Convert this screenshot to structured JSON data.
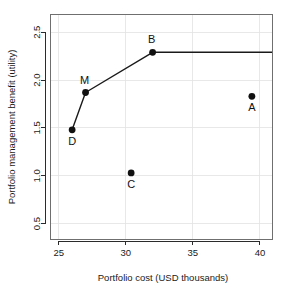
{
  "chart_data": {
    "type": "scatter",
    "title": "",
    "xlabel": "Portfolio cost (USD thousands)",
    "ylabel": "Portfolio management benefit (utility)",
    "xlim": [
      24.35,
      40.9
    ],
    "ylim": [
      0.34,
      2.69
    ],
    "xticks": [
      25,
      30,
      35,
      40
    ],
    "xticklabels": [
      "25",
      "30",
      "35",
      "40"
    ],
    "yticks": [
      0.5,
      1.0,
      1.5,
      2.0,
      2.5
    ],
    "yticklabels": [
      "0.5",
      "1.0",
      "1.5",
      "2.0",
      "2.5"
    ],
    "grid": true,
    "legend": "none",
    "points": [
      {
        "label": "A",
        "x": 39.4,
        "y": 1.83,
        "label_dx": 0,
        "label_dy": 15
      },
      {
        "label": "B",
        "x": 32.0,
        "y": 2.29,
        "label_dx": -1,
        "label_dy": -9
      },
      {
        "label": "C",
        "x": 30.4,
        "y": 1.03,
        "label_dx": 0,
        "label_dy": 15
      },
      {
        "label": "D",
        "x": 26.0,
        "y": 1.48,
        "label_dx": 0,
        "label_dy": 15
      },
      {
        "label": "M",
        "x": 27.0,
        "y": 1.87,
        "label_dx": -1,
        "label_dy": -9
      }
    ],
    "frontier": {
      "name": "efficient frontier",
      "points": [
        {
          "x": 26.0,
          "y": 1.48
        },
        {
          "x": 27.0,
          "y": 1.87
        },
        {
          "x": 32.0,
          "y": 2.29
        },
        {
          "x": 40.9,
          "y": 2.29
        }
      ]
    },
    "colors": {
      "point": "#111111",
      "line": "#1a1a1a",
      "grid": "#e2e2e2",
      "axis": "#2b2b2b",
      "background": "#ffffff"
    }
  }
}
